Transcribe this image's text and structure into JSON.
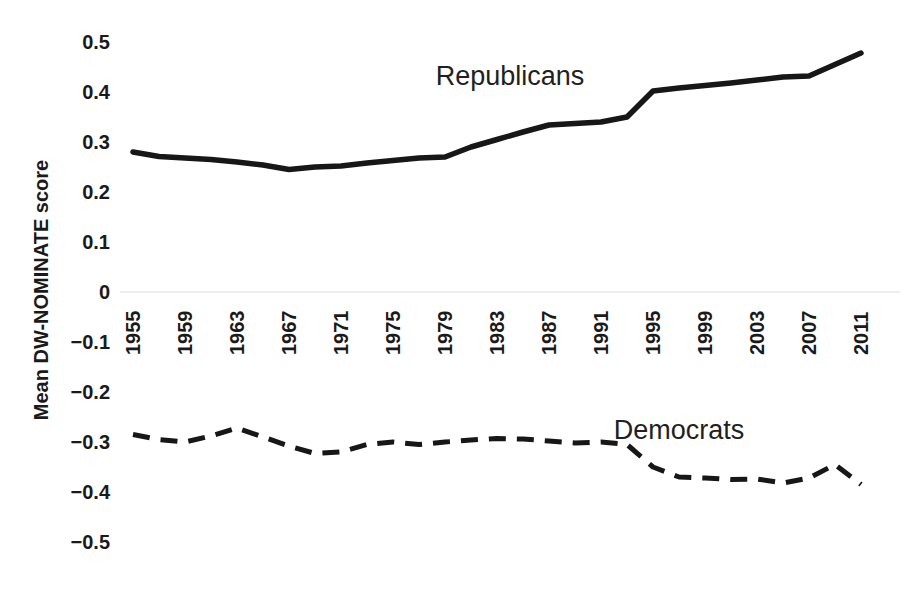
{
  "chart_data": {
    "type": "line",
    "title": "",
    "xlabel": "",
    "ylabel": "Mean DW-NOMINATE score",
    "ylim": [
      -0.5,
      0.5
    ],
    "xlim": [
      1955,
      2011
    ],
    "grid": false,
    "legend_position": "inline-annotation",
    "ytick_labels": [
      "0.5",
      "0.4",
      "0.3",
      "0.2",
      "0.1",
      "0",
      "−0.1",
      "−0.2",
      "−0.3",
      "−0.4",
      "−0.5"
    ],
    "ytick_values": [
      0.5,
      0.4,
      0.3,
      0.2,
      0.1,
      0,
      -0.1,
      -0.2,
      -0.3,
      -0.4,
      -0.5
    ],
    "xtick_labels": [
      "1955",
      "1959",
      "1963",
      "1967",
      "1971",
      "1975",
      "1979",
      "1983",
      "1987",
      "1991",
      "1995",
      "1999",
      "2003",
      "2007",
      "2011"
    ],
    "xtick_values": [
      1955,
      1959,
      1963,
      1967,
      1971,
      1975,
      1979,
      1983,
      1987,
      1991,
      1995,
      1999,
      2003,
      2007,
      2011
    ],
    "x": [
      1955,
      1957,
      1959,
      1961,
      1963,
      1965,
      1967,
      1969,
      1971,
      1973,
      1975,
      1977,
      1979,
      1981,
      1983,
      1985,
      1987,
      1989,
      1991,
      1993,
      1995,
      1997,
      1999,
      2001,
      2003,
      2005,
      2007,
      2009,
      2011
    ],
    "series": [
      {
        "name": "Republicans",
        "style": "solid",
        "color": "#171717",
        "label_x": 1984,
        "label_y": 0.415,
        "values": [
          0.28,
          0.271,
          0.268,
          0.265,
          0.26,
          0.254,
          0.245,
          0.25,
          0.252,
          0.258,
          0.263,
          0.268,
          0.27,
          0.29,
          0.305,
          0.32,
          0.334,
          0.337,
          0.34,
          0.35,
          0.402,
          0.408,
          0.413,
          0.418,
          0.424,
          0.43,
          0.432,
          0.455,
          0.478
        ]
      },
      {
        "name": "Democrats",
        "style": "dashed",
        "color": "#171717",
        "label_x": 1997,
        "label_y": -0.293,
        "values": [
          -0.285,
          -0.295,
          -0.3,
          -0.288,
          -0.272,
          -0.29,
          -0.308,
          -0.323,
          -0.32,
          -0.305,
          -0.3,
          -0.305,
          -0.3,
          -0.296,
          -0.293,
          -0.294,
          -0.298,
          -0.302,
          -0.3,
          -0.305,
          -0.35,
          -0.37,
          -0.372,
          -0.375,
          -0.374,
          -0.382,
          -0.372,
          -0.345,
          -0.385
        ]
      }
    ]
  },
  "annotations": {
    "republicans_label": "Republicans",
    "democrats_label": "Democrats"
  },
  "axis": {
    "y_title": "Mean DW-NOMINATE score"
  }
}
